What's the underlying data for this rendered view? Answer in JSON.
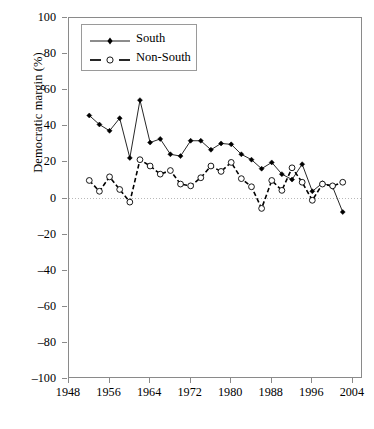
{
  "chart_data": {
    "type": "line",
    "title": "",
    "xlabel": "",
    "ylabel": "Democratic margin (%)",
    "xlim": [
      1948,
      2006
    ],
    "ylim": [
      -100,
      100
    ],
    "grid": false,
    "zero_reference_line": true,
    "legend_position": "top-left",
    "xticks": [
      1948,
      1956,
      1964,
      1972,
      1980,
      1988,
      1996,
      2004
    ],
    "yticks": [
      100,
      80,
      60,
      40,
      20,
      0,
      -20,
      -40,
      -60,
      -80,
      -100
    ],
    "ytick_labels": [
      "100",
      "80",
      "60",
      "40",
      "20",
      "0",
      "–20",
      "–40",
      "–60",
      "–80",
      "–100"
    ],
    "xtick_labels": [
      "1948",
      "1956",
      "1964",
      "1972",
      "1980",
      "1988",
      "1996",
      "2004"
    ],
    "x": [
      1952,
      1954,
      1956,
      1958,
      1960,
      1962,
      1964,
      1966,
      1968,
      1970,
      1972,
      1974,
      1976,
      1978,
      1980,
      1982,
      1984,
      1986,
      1988,
      1990,
      1992,
      1994,
      1996,
      1998,
      2000,
      2002
    ],
    "series": [
      {
        "name": "South",
        "marker": "filled-diamond",
        "line_style": "solid",
        "color": "#000000",
        "values": [
          46,
          41,
          37.5,
          44.5,
          22.5,
          54.5,
          31,
          33,
          24.5,
          23.5,
          32,
          32,
          27,
          30.5,
          30,
          24.5,
          21.5,
          16.5,
          20,
          13.5,
          10.5,
          19,
          4,
          8.5,
          6.5,
          -7.5
        ]
      },
      {
        "name": "Non-South",
        "marker": "open-circle",
        "line_style": "dashed",
        "color": "#000000",
        "values": [
          10,
          4,
          12,
          5,
          -2,
          21.5,
          18,
          13.5,
          15.5,
          8,
          7,
          11.5,
          18,
          15,
          20,
          11,
          6.5,
          -5.5,
          10,
          4.5,
          17,
          9,
          -1,
          8,
          7,
          9
        ]
      }
    ]
  },
  "legend": {
    "entries": [
      {
        "label": "South"
      },
      {
        "label": "Non-South"
      }
    ]
  }
}
